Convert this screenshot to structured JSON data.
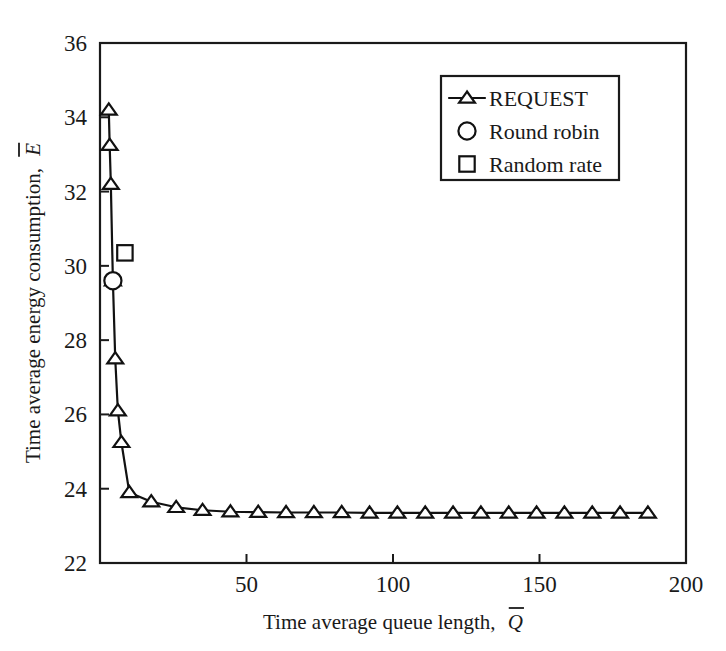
{
  "chart_data": {
    "type": "line",
    "title": "",
    "xlabel": "Time average queue length, Q̅",
    "ylabel": "Time average energy consumption, E̅",
    "xlabel_main": "Time average queue length,",
    "xlabel_symbol": "Q",
    "ylabel_main": "Time average energy consumption,",
    "ylabel_symbol": "E",
    "xlim": [
      0,
      200
    ],
    "ylim": [
      22,
      36
    ],
    "xticks": [
      50,
      100,
      150,
      200
    ],
    "yticks": [
      22,
      24,
      26,
      28,
      30,
      32,
      34,
      36
    ],
    "xtick_labels": [
      "50",
      "100",
      "150",
      "200"
    ],
    "ytick_labels": [
      "22",
      "24",
      "26",
      "28",
      "30",
      "32",
      "34",
      "36"
    ],
    "grid": false,
    "legend_position": "upper right",
    "series": [
      {
        "name": "REQUEST",
        "marker": "triangle",
        "line": true,
        "color": "#111111",
        "points": [
          [
            3.0,
            34.2
          ],
          [
            3.3,
            33.25
          ],
          [
            3.7,
            32.2
          ],
          [
            4.4,
            29.6
          ],
          [
            5.2,
            27.5
          ],
          [
            6.1,
            26.1
          ],
          [
            7.3,
            25.25
          ],
          [
            10.0,
            23.9
          ],
          [
            17.5,
            23.65
          ],
          [
            26.0,
            23.5
          ],
          [
            35.0,
            23.42
          ],
          [
            44.5,
            23.38
          ],
          [
            54.0,
            23.37
          ],
          [
            63.5,
            23.36
          ],
          [
            73.0,
            23.36
          ],
          [
            82.5,
            23.36
          ],
          [
            92.0,
            23.35
          ],
          [
            101.5,
            23.35
          ],
          [
            111.0,
            23.35
          ],
          [
            120.5,
            23.35
          ],
          [
            130.0,
            23.35
          ],
          [
            139.5,
            23.35
          ],
          [
            149.0,
            23.35
          ],
          [
            158.5,
            23.35
          ],
          [
            168.0,
            23.35
          ],
          [
            177.5,
            23.35
          ],
          [
            187.0,
            23.35
          ]
        ]
      },
      {
        "name": "Round robin",
        "marker": "circle",
        "line": false,
        "color": "#111111",
        "points": [
          [
            4.4,
            29.6
          ]
        ]
      },
      {
        "name": "Random rate",
        "marker": "square",
        "line": false,
        "color": "#111111",
        "points": [
          [
            8.5,
            30.35
          ]
        ]
      }
    ],
    "legend": [
      {
        "label": "REQUEST",
        "marker": "triangle",
        "line": true
      },
      {
        "label": "Round robin",
        "marker": "circle",
        "line": false
      },
      {
        "label": "Random rate",
        "marker": "square",
        "line": false
      }
    ]
  },
  "legend": {
    "items": [
      {
        "label": "REQUEST"
      },
      {
        "label": "Round robin"
      },
      {
        "label": "Random rate"
      }
    ]
  }
}
